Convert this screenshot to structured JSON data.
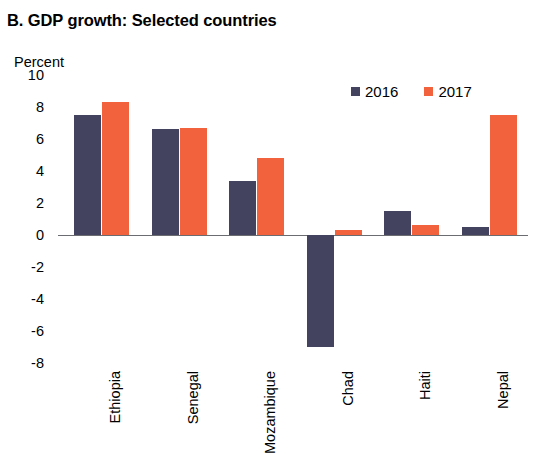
{
  "chart_data": {
    "type": "bar",
    "title": "B. GDP growth: Selected countries",
    "xlabel": "",
    "ylabel": "Percent",
    "ylim": [
      -8,
      10
    ],
    "ytick_labels": [
      "10",
      "8",
      "6",
      "4",
      "2",
      "0",
      "-2",
      "-4",
      "-6",
      "-8"
    ],
    "yticks": [
      10,
      8,
      6,
      4,
      2,
      0,
      -2,
      -4,
      -6,
      -8
    ],
    "grid": false,
    "legend_position": "top-right",
    "zero_line": true,
    "categories": [
      "Ethiopia",
      "Senegal",
      "Mozambique",
      "Chad",
      "Haiti",
      "Nepal"
    ],
    "series": [
      {
        "name": "2016",
        "color": "#43435f",
        "values": [
          7.5,
          6.6,
          3.4,
          -7.0,
          1.5,
          0.5
        ]
      },
      {
        "name": "2017",
        "color": "#f2623c",
        "values": [
          8.3,
          6.7,
          4.8,
          0.3,
          0.6,
          7.5
        ]
      }
    ]
  },
  "legend": {
    "items": [
      {
        "label": "2016",
        "swatch": "legend-swatch-2016"
      },
      {
        "label": "2017",
        "swatch": "legend-swatch-2017"
      }
    ]
  }
}
